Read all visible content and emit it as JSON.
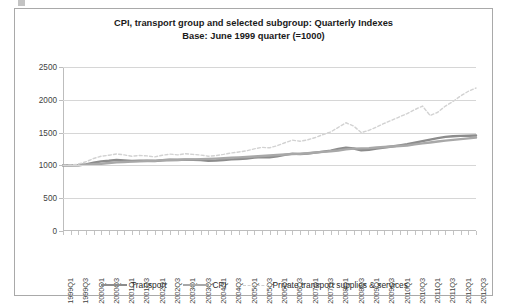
{
  "chart_data": {
    "type": "line",
    "title": "CPI, transport group and selected subgroup: Quarterly Indexes",
    "subtitle": "Base: June 1999 quarter (=1000)",
    "xlabel": "",
    "ylabel": "",
    "ylim": [
      0,
      2500
    ],
    "yticks": [
      0,
      500,
      1000,
      1500,
      2000,
      2500
    ],
    "grid": true,
    "legend_position": "bottom",
    "x": [
      "1999Q1",
      "1999Q2",
      "1999Q3",
      "1999Q4",
      "2000Q1",
      "2000Q2",
      "2000Q3",
      "2000Q4",
      "2001Q1",
      "2001Q2",
      "2001Q3",
      "2001Q4",
      "2002Q1",
      "2002Q2",
      "2002Q3",
      "2002Q4",
      "2003Q1",
      "2003Q2",
      "2003Q3",
      "2003Q4",
      "2004Q1",
      "2004Q2",
      "2004Q3",
      "2004Q4",
      "2005Q1",
      "2005Q2",
      "2005Q3",
      "2005Q4",
      "2006Q1",
      "2006Q2",
      "2006Q3",
      "2006Q4",
      "2007Q1",
      "2007Q2",
      "2007Q3",
      "2007Q4",
      "2008Q1",
      "2008Q2",
      "2008Q3",
      "2008Q4",
      "2009Q1",
      "2009Q2",
      "2009Q3",
      "2009Q4",
      "2010Q1",
      "2010Q2",
      "2010Q3",
      "2010Q4",
      "2011Q1",
      "2011Q2",
      "2011Q3",
      "2011Q4",
      "2012Q1",
      "2012Q2",
      "2012Q3"
    ],
    "x_tick_labels": [
      "1999Q1",
      "1999Q3",
      "2000Q1",
      "2000Q3",
      "2001Q1",
      "2001Q3",
      "2002Q1",
      "2002Q3",
      "2003Q1",
      "2003Q3",
      "2004Q1",
      "2004Q3",
      "2005Q1",
      "2005Q3",
      "2006Q1",
      "2006Q3",
      "2007Q1",
      "2007Q3",
      "2008Q1",
      "2008Q3",
      "2009Q1",
      "2009Q3",
      "2010Q1",
      "2010Q3",
      "2011Q1",
      "2011Q3",
      "2012Q1",
      "2012Q3"
    ],
    "series": [
      {
        "name": "Transport",
        "color": "#8c8c8c",
        "style": "solid",
        "width": 2.4,
        "values": [
          1000,
          1000,
          1002,
          1015,
          1040,
          1062,
          1070,
          1082,
          1075,
          1068,
          1072,
          1070,
          1066,
          1078,
          1085,
          1082,
          1088,
          1085,
          1080,
          1072,
          1075,
          1082,
          1092,
          1098,
          1105,
          1118,
          1128,
          1125,
          1140,
          1160,
          1180,
          1172,
          1182,
          1195,
          1210,
          1225,
          1250,
          1270,
          1258,
          1230,
          1238,
          1255,
          1272,
          1288,
          1305,
          1322,
          1345,
          1370,
          1392,
          1415,
          1435,
          1445,
          1450,
          1452,
          1455
        ]
      },
      {
        "name": "CPI",
        "color": "#a8a8a8",
        "style": "solid",
        "width": 2.4,
        "values": [
          1000,
          1002,
          1005,
          1012,
          1018,
          1026,
          1036,
          1046,
          1052,
          1058,
          1062,
          1068,
          1072,
          1078,
          1082,
          1086,
          1090,
          1092,
          1096,
          1100,
          1104,
          1110,
          1116,
          1122,
          1128,
          1136,
          1144,
          1150,
          1158,
          1166,
          1172,
          1178,
          1186,
          1196,
          1206,
          1216,
          1228,
          1244,
          1256,
          1260,
          1264,
          1272,
          1280,
          1288,
          1296,
          1304,
          1320,
          1336,
          1350,
          1364,
          1378,
          1390,
          1400,
          1412,
          1425
        ]
      },
      {
        "name": "Private transport supplies & services",
        "color": "#d2d2d2",
        "style": "dashed",
        "width": 1.4,
        "values": [
          1000,
          1005,
          1020,
          1055,
          1105,
          1140,
          1155,
          1175,
          1160,
          1140,
          1152,
          1145,
          1130,
          1155,
          1172,
          1160,
          1178,
          1168,
          1158,
          1140,
          1150,
          1168,
          1190,
          1205,
          1222,
          1252,
          1275,
          1268,
          1300,
          1345,
          1385,
          1368,
          1390,
          1425,
          1470,
          1510,
          1580,
          1650,
          1600,
          1500,
          1535,
          1585,
          1640,
          1690,
          1740,
          1790,
          1850,
          1905,
          1760,
          1810,
          1905,
          1975,
          2060,
          2130,
          2180
        ]
      }
    ]
  },
  "legend": [
    {
      "label": "Transport"
    },
    {
      "label": "CPI"
    },
    {
      "label": "Private transport supplies & services"
    }
  ]
}
